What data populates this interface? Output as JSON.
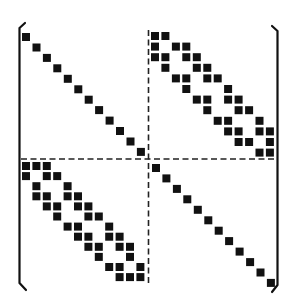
{
  "diagram": {
    "type": "block-sparse-matrix",
    "size": 24,
    "block_size": 12,
    "colors": {
      "ink": "#111111",
      "background": "#ffffff"
    },
    "blocks": {
      "top_left": {
        "pattern": "diagonal",
        "cells": [
          [
            0,
            0
          ],
          [
            1,
            1
          ],
          [
            2,
            2
          ],
          [
            3,
            3
          ],
          [
            4,
            4
          ],
          [
            5,
            5
          ],
          [
            6,
            6
          ],
          [
            7,
            7
          ],
          [
            8,
            8
          ],
          [
            9,
            9
          ],
          [
            10,
            10
          ],
          [
            11,
            11
          ]
        ]
      },
      "top_right": {
        "pattern": "banded",
        "cells": [
          [
            0,
            0
          ],
          [
            0,
            1
          ],
          [
            1,
            0
          ],
          [
            1,
            2
          ],
          [
            1,
            3
          ],
          [
            2,
            0
          ],
          [
            2,
            1
          ],
          [
            2,
            3
          ],
          [
            2,
            4
          ],
          [
            3,
            1
          ],
          [
            3,
            4
          ],
          [
            3,
            5
          ],
          [
            4,
            2
          ],
          [
            4,
            3
          ],
          [
            4,
            5
          ],
          [
            4,
            6
          ],
          [
            5,
            3
          ],
          [
            5,
            7
          ],
          [
            6,
            4
          ],
          [
            6,
            5
          ],
          [
            6,
            7
          ],
          [
            6,
            8
          ],
          [
            7,
            5
          ],
          [
            7,
            8
          ],
          [
            7,
            9
          ],
          [
            8,
            6
          ],
          [
            8,
            7
          ],
          [
            8,
            10
          ],
          [
            9,
            7
          ],
          [
            9,
            8
          ],
          [
            9,
            10
          ],
          [
            9,
            11
          ],
          [
            10,
            8
          ],
          [
            10,
            9
          ],
          [
            10,
            11
          ],
          [
            11,
            10
          ],
          [
            11,
            11
          ]
        ]
      },
      "bottom_left": {
        "pattern": "banded",
        "cells": [
          [
            0,
            0
          ],
          [
            0,
            1
          ],
          [
            0,
            2
          ],
          [
            1,
            0
          ],
          [
            1,
            2
          ],
          [
            1,
            3
          ],
          [
            2,
            1
          ],
          [
            2,
            4
          ],
          [
            3,
            1
          ],
          [
            3,
            2
          ],
          [
            3,
            4
          ],
          [
            3,
            5
          ],
          [
            4,
            2
          ],
          [
            4,
            3
          ],
          [
            4,
            5
          ],
          [
            4,
            6
          ],
          [
            5,
            3
          ],
          [
            5,
            6
          ],
          [
            5,
            7
          ],
          [
            6,
            4
          ],
          [
            6,
            5
          ],
          [
            6,
            8
          ],
          [
            7,
            5
          ],
          [
            7,
            6
          ],
          [
            7,
            8
          ],
          [
            7,
            9
          ],
          [
            8,
            6
          ],
          [
            8,
            7
          ],
          [
            8,
            9
          ],
          [
            8,
            10
          ],
          [
            9,
            7
          ],
          [
            9,
            10
          ],
          [
            10,
            8
          ],
          [
            10,
            9
          ],
          [
            10,
            11
          ],
          [
            11,
            9
          ],
          [
            11,
            10
          ],
          [
            11,
            11
          ]
        ]
      },
      "bottom_right": {
        "pattern": "diagonal",
        "cells": [
          [
            0,
            0
          ],
          [
            1,
            1
          ],
          [
            2,
            2
          ],
          [
            3,
            3
          ],
          [
            4,
            4
          ],
          [
            5,
            5
          ],
          [
            6,
            6
          ],
          [
            7,
            7
          ],
          [
            8,
            8
          ],
          [
            9,
            9
          ],
          [
            10,
            10
          ],
          [
            11,
            11
          ]
        ]
      }
    },
    "dividers": {
      "style": "dashed",
      "orientation": [
        "horizontal",
        "vertical"
      ]
    },
    "brackets": {
      "left": "(",
      "right": ")"
    }
  }
}
